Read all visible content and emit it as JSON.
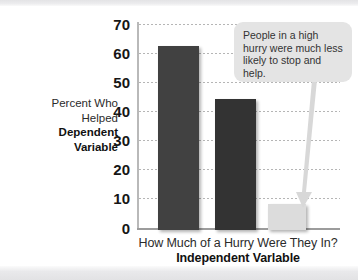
{
  "chart_data": {
    "type": "bar",
    "title": "",
    "subtitle": "",
    "categories": [
      "High hurry",
      "Medium hurry",
      "Low hurry"
    ],
    "values": [
      63,
      45,
      9
    ],
    "bar_colors": [
      "#414141",
      "#333333",
      "#dcdcdc"
    ],
    "xlabel": "How Much of a Hurry Were They In?",
    "xlabel_bold": "Independent Varlable",
    "ylabel_line1": "Percent Who",
    "ylabel_line2": "Helped",
    "ylabel_bold_line1": "Dependent",
    "ylabel_bold_line2": "Variable",
    "ylim": [
      0,
      70
    ],
    "ytick_labels": [
      "70",
      "60",
      "50",
      "40",
      "30",
      "20",
      "10",
      "0"
    ],
    "ytick_values": [
      70,
      60,
      50,
      40,
      30,
      20,
      10,
      0
    ],
    "grid": true,
    "grid_style": "dotted-horizontal",
    "legend": "none",
    "annotations": [
      {
        "text": "People in a high hurry were much less likely to stop and help.",
        "points_to_category": "Low hurry",
        "background": "#e4e4e4",
        "text_color": "#333333"
      }
    ]
  },
  "axis": {
    "y_title": {
      "line1": "Percent Who",
      "line2": "Helped",
      "line3": "Dependent",
      "line4": "Variable"
    },
    "x_title": {
      "line1": "How Much of a Hurry Were They In?",
      "line2": "Independent Varlable"
    },
    "ticks": [
      "70",
      "60",
      "50",
      "40",
      "30",
      "20",
      "10",
      "0"
    ]
  },
  "callout": {
    "text": "People in a high hurry were much less likely to stop and help."
  },
  "colors": {
    "bar_dark_1": "#414141",
    "bar_dark_2": "#333333",
    "bar_light": "#dcdcdc",
    "gridline": "#b5b5b5",
    "axis": "#9c9c9c",
    "callout_bg": "#e4e4e4",
    "page_band": "#e6e6e8"
  }
}
